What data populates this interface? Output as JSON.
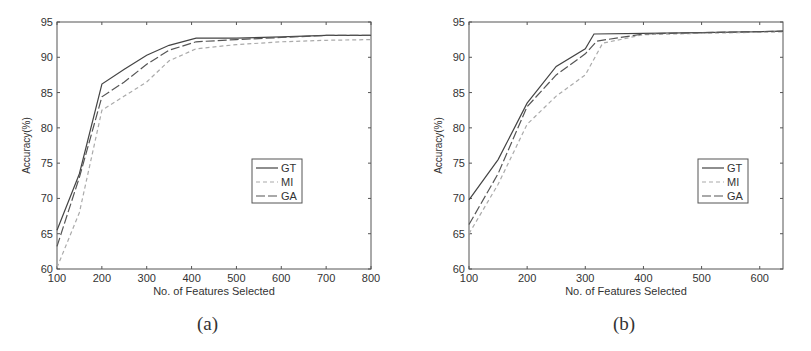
{
  "chart_data": [
    {
      "id": "a",
      "type": "line",
      "caption": "(a)",
      "title": "",
      "xlabel": "No. of Features Selected",
      "ylabel": "Accuracy(%)",
      "xlim": [
        100,
        800
      ],
      "ylim": [
        60,
        95
      ],
      "xticks": [
        100,
        200,
        300,
        400,
        500,
        600,
        700,
        800
      ],
      "yticks": [
        60,
        65,
        70,
        75,
        80,
        85,
        90,
        95
      ],
      "grid": false,
      "legend_position": "center-right",
      "series": [
        {
          "name": "GT",
          "style": "solid",
          "color": "#444444",
          "x": [
            100,
            150,
            200,
            250,
            300,
            350,
            410,
            500,
            600,
            700,
            800
          ],
          "y": [
            65.5,
            73.5,
            86.2,
            88.3,
            90.3,
            91.7,
            92.7,
            92.7,
            92.9,
            93.1,
            93.1
          ]
        },
        {
          "name": "MI",
          "style": "dashed",
          "color": "#aaaaaa",
          "x": [
            100,
            150,
            200,
            250,
            300,
            350,
            410,
            500,
            600,
            700,
            800
          ],
          "y": [
            60.2,
            68.0,
            82.5,
            84.5,
            86.5,
            89.5,
            91.2,
            91.8,
            92.2,
            92.4,
            92.5
          ]
        },
        {
          "name": "GA",
          "style": "long-dash",
          "color": "#555555",
          "x": [
            100,
            150,
            200,
            250,
            300,
            350,
            410,
            500,
            600,
            700,
            800
          ],
          "y": [
            63.2,
            73.0,
            84.4,
            86.5,
            89.0,
            91.0,
            92.2,
            92.5,
            92.8,
            93.1,
            93.1
          ]
        }
      ]
    },
    {
      "id": "b",
      "type": "line",
      "caption": "(b)",
      "title": "",
      "xlabel": "No. of Features Selected",
      "ylabel": "Accuracy(%)",
      "xlim": [
        100,
        640
      ],
      "ylim": [
        60,
        95
      ],
      "xticks": [
        100,
        200,
        300,
        400,
        500,
        600
      ],
      "yticks": [
        60,
        65,
        70,
        75,
        80,
        85,
        90,
        95
      ],
      "grid": false,
      "legend_position": "center-right",
      "series": [
        {
          "name": "GT",
          "style": "solid",
          "color": "#444444",
          "x": [
            100,
            150,
            200,
            250,
            300,
            315,
            400,
            500,
            640
          ],
          "y": [
            69.8,
            75.5,
            83.5,
            88.7,
            91.2,
            93.3,
            93.4,
            93.5,
            93.7
          ]
        },
        {
          "name": "MI",
          "style": "dashed",
          "color": "#aaaaaa",
          "x": [
            100,
            150,
            200,
            250,
            300,
            330,
            400,
            500,
            640
          ],
          "y": [
            65.0,
            72.0,
            80.5,
            84.5,
            87.5,
            92.0,
            93.2,
            93.4,
            93.6
          ]
        },
        {
          "name": "GA",
          "style": "long-dash",
          "color": "#555555",
          "x": [
            100,
            150,
            200,
            250,
            300,
            320,
            400,
            500,
            640
          ],
          "y": [
            66.3,
            73.5,
            83.0,
            87.5,
            90.5,
            92.3,
            93.3,
            93.5,
            93.7
          ]
        }
      ]
    }
  ]
}
